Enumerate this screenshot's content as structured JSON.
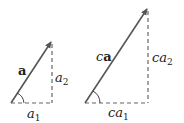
{
  "figure": {
    "colors": {
      "vector": "#555555",
      "dashed": "#666666",
      "text": "#222222",
      "background": "#ffffff"
    },
    "left_triangle": {
      "vector_label": "a",
      "horizontal_label_base": "a",
      "horizontal_label_sub": "1",
      "vertical_label_base": "a",
      "vertical_label_sub": "2",
      "origin": [
        11,
        103
      ],
      "tip": [
        52,
        41
      ]
    },
    "right_triangle": {
      "vector_label_scalar": "c",
      "vector_label": "a",
      "horizontal_label_base": "ca",
      "horizontal_label_sub": "1",
      "vertical_label_base": "ca",
      "vertical_label_sub": "2",
      "origin": [
        85,
        103
      ],
      "tip": [
        148,
        8
      ]
    }
  }
}
